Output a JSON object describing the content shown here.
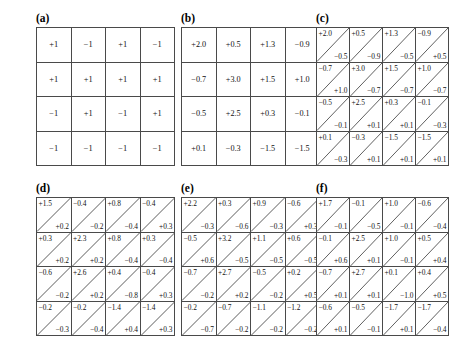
{
  "figure": {
    "panels": [
      {
        "id": "a",
        "label": "(a)",
        "type": "single",
        "rows": [
          [
            {
              "v": "+1"
            },
            {
              "v": "−1"
            },
            {
              "v": "+1"
            },
            {
              "v": "−1"
            }
          ],
          [
            {
              "v": "+1"
            },
            {
              "v": "+1"
            },
            {
              "v": "+1"
            },
            {
              "v": "+1"
            }
          ],
          [
            {
              "v": "−1"
            },
            {
              "v": "+1"
            },
            {
              "v": "−1"
            },
            {
              "v": "+1"
            }
          ],
          [
            {
              "v": "−1"
            },
            {
              "v": "−1"
            },
            {
              "v": "−1"
            },
            {
              "v": "−1"
            }
          ]
        ]
      },
      {
        "id": "b",
        "label": "(b)",
        "type": "single",
        "rows": [
          [
            {
              "v": "+2.0"
            },
            {
              "v": "+0.5",
              "shaded": true
            },
            {
              "v": "+1.3"
            },
            {
              "v": "−0.9"
            }
          ],
          [
            {
              "v": "−0.7",
              "shaded": true
            },
            {
              "v": "+3.0"
            },
            {
              "v": "+1.5"
            },
            {
              "v": "+1.0"
            }
          ],
          [
            {
              "v": "−0.5"
            },
            {
              "v": "+2.5"
            },
            {
              "v": "+0.3",
              "shaded": true
            },
            {
              "v": "−0.1",
              "shaded": true
            }
          ],
          [
            {
              "v": "+0.1",
              "shaded": true
            },
            {
              "v": "−0.3"
            },
            {
              "v": "−1.5"
            },
            {
              "v": "−1.5"
            }
          ]
        ]
      },
      {
        "id": "c",
        "label": "(c)",
        "type": "split",
        "rows": [
          [
            {
              "t": "+2.0",
              "b": "−0.5"
            },
            {
              "t": "+0.5",
              "b": "−0.9"
            },
            {
              "t": "+1.3",
              "b": "−0.5"
            },
            {
              "t": "−0.9",
              "b": "+0.5"
            }
          ],
          [
            {
              "t": "−0.7",
              "b": "+1.0"
            },
            {
              "t": "+3.0",
              "b": "−0.7",
              "shaded": true
            },
            {
              "t": "+1.5",
              "b": "−0.7"
            },
            {
              "t": "+1.0",
              "b": "−0.7"
            }
          ],
          [
            {
              "t": "−0.5",
              "b": "−0.1"
            },
            {
              "t": "+2.5",
              "b": "+0.1"
            },
            {
              "t": "+0.3",
              "b": "+0.1",
              "shaded": true
            },
            {
              "t": "−0.1",
              "b": "−0.3",
              "shaded": true
            }
          ],
          [
            {
              "t": "+0.1",
              "b": "−0.3"
            },
            {
              "t": "−0.3",
              "b": "+0.1"
            },
            {
              "t": "−1.5",
              "b": "+0.1"
            },
            {
              "t": "−1.5",
              "b": "+0.1"
            }
          ]
        ]
      },
      {
        "id": "d",
        "label": "(d)",
        "type": "split",
        "rows": [
          [
            {
              "t": "+1.5",
              "b": "+0.2"
            },
            {
              "t": "−0.4",
              "b": "−0.2"
            },
            {
              "t": "+0.8",
              "b": "−0.4"
            },
            {
              "t": "−0.4",
              "b": "+0.3"
            }
          ],
          [
            {
              "t": "+0.3",
              "b": "+0.2"
            },
            {
              "t": "+2.3",
              "b": "+0.2"
            },
            {
              "t": "+0.8",
              "b": "−0.4"
            },
            {
              "t": "+0.3",
              "b": "−0.4",
              "shaded": true
            }
          ],
          [
            {
              "t": "−0.6",
              "b": "−0.2"
            },
            {
              "t": "+2.6",
              "b": "+0.2"
            },
            {
              "t": "+0.4",
              "b": "−0.8"
            },
            {
              "t": "−0.4",
              "b": "+0.3",
              "shaded": true
            }
          ],
          [
            {
              "t": "−0.2",
              "b": "−0.3"
            },
            {
              "t": "−0.2",
              "b": "−0.4"
            },
            {
              "t": "−1.4",
              "b": "+0.4"
            },
            {
              "t": "−1.4",
              "b": "+0.3"
            }
          ]
        ]
      },
      {
        "id": "e",
        "label": "(e)",
        "type": "split",
        "rows": [
          [
            {
              "t": "+2.2",
              "b": "−0.3"
            },
            {
              "t": "+0.3",
              "b": "−0.6"
            },
            {
              "t": "+0.9",
              "b": "−0.3"
            },
            {
              "t": "−0.6",
              "b": "+0.3"
            }
          ],
          [
            {
              "t": "−0.5",
              "b": "+0.6"
            },
            {
              "t": "+3.2",
              "b": "−0.5"
            },
            {
              "t": "+1.1",
              "b": "−0.5"
            },
            {
              "t": "+0.6",
              "b": "−0.5"
            }
          ],
          [
            {
              "t": "−0.7",
              "b": "−0.2"
            },
            {
              "t": "+2.7",
              "b": "+0.2"
            },
            {
              "t": "−0.5",
              "b": "−0.2"
            },
            {
              "t": "+0.2",
              "b": "+0.5"
            }
          ],
          [
            {
              "t": "−0.2",
              "b": "−0.7"
            },
            {
              "t": "−0.7",
              "b": "−0.2"
            },
            {
              "t": "−1.1",
              "b": "−0.2"
            },
            {
              "t": "−1.2",
              "b": "−0.2"
            }
          ]
        ]
      },
      {
        "id": "f",
        "label": "(f)",
        "type": "split",
        "rows": [
          [
            {
              "t": "+1.7",
              "b": "−0.1"
            },
            {
              "t": "−0.1",
              "b": "−0.5"
            },
            {
              "t": "+1.0",
              "b": "−0.1"
            },
            {
              "t": "−0.6",
              "b": "−0.4"
            }
          ],
          [
            {
              "t": "−0.1",
              "b": "+0.6"
            },
            {
              "t": "+2.5",
              "b": "+0.1"
            },
            {
              "t": "+1.0",
              "b": "−0.1"
            },
            {
              "t": "+0.5",
              "b": "+0.4"
            }
          ],
          [
            {
              "t": "−0.7",
              "b": "+0.1"
            },
            {
              "t": "+2.7",
              "b": "+0.1"
            },
            {
              "t": "+0.1",
              "b": "−1.0"
            },
            {
              "t": "+0.4",
              "b": "+0.5"
            }
          ],
          [
            {
              "t": "−0.6",
              "b": "+0.1"
            },
            {
              "t": "−0.5",
              "b": "−0.1"
            },
            {
              "t": "−1.7",
              "b": "+0.1"
            },
            {
              "t": "−1.7",
              "b": "−0.4"
            }
          ]
        ]
      }
    ],
    "colors": {
      "shaded_cell": "#c9c9c9",
      "cell_border": "#4a4a4a",
      "diagonal": "#5a5a5a",
      "text": "#111111",
      "background": "#ffffff"
    }
  }
}
